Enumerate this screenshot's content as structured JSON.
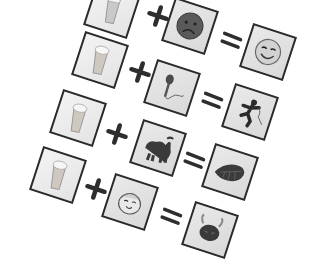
{
  "puzzle": {
    "type": "picture-equation rebus",
    "rows": [
      {
        "left": "beer-glass",
        "operator": "+",
        "middle": "sad-face",
        "equals": "=",
        "result": "happy-wink-face"
      },
      {
        "left": "beer-glass",
        "operator": "+",
        "middle": "microphone",
        "equals": "=",
        "result": "running-man"
      },
      {
        "left": "beer-glass",
        "operator": "+",
        "middle": "black-cat",
        "equals": "=",
        "result": "leaf-bug"
      },
      {
        "left": "beer-glass",
        "operator": "+",
        "middle": "smiling-face-cap",
        "equals": "=",
        "result": "bull-head"
      }
    ]
  },
  "colors": {
    "card_border": "#2a2a2a",
    "card_fill": "#e0e0e0",
    "ink": "#333333",
    "background": "#ffffff"
  }
}
